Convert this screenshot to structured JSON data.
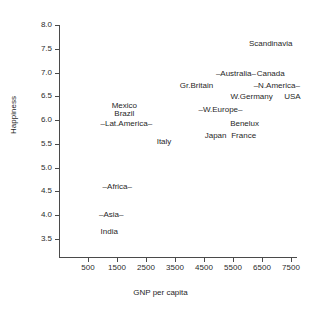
{
  "chart_data": {
    "type": "scatter",
    "title": "",
    "xlabel": "GNP per capita",
    "ylabel": "Happiness",
    "xlim": [
      0,
      7800
    ],
    "ylim": [
      3.3,
      8.0
    ],
    "grid": false,
    "legend": "none",
    "note": "Text labels are plotted in place of point markers; some labels are bracketed by en-dashes to denote aggregate regions.",
    "x_ticks": [
      500,
      1500,
      2500,
      3500,
      4500,
      5500,
      6500,
      7500
    ],
    "x_tick_labels": [
      "500",
      "1500",
      "2500",
      "3500",
      "4500",
      "5500",
      "6500",
      "7500"
    ],
    "y_ticks": [
      3.5,
      4.0,
      4.5,
      5.0,
      5.5,
      6.0,
      6.5,
      7.0,
      7.5,
      8.0
    ],
    "y_tick_labels": [
      "3.5",
      "4.0",
      "4.5",
      "5.0",
      "5.5",
      "6.0",
      "6.5",
      "7.0",
      "7.5",
      "8.0"
    ],
    "points": [
      {
        "label": "Scandinavia",
        "x": 6800,
        "y": 7.6
      },
      {
        "label": "–Australia–",
        "x": 5600,
        "y": 6.98
      },
      {
        "label": "Canada",
        "x": 6800,
        "y": 6.98
      },
      {
        "label": "–N.America–",
        "x": 7010,
        "y": 6.72
      },
      {
        "label": "Gr.Britain",
        "x": 4240,
        "y": 6.72
      },
      {
        "label": "W.Germany",
        "x": 6140,
        "y": 6.48
      },
      {
        "label": "USA",
        "x": 7550,
        "y": 6.48
      },
      {
        "label": "–W.Europe–",
        "x": 5070,
        "y": 6.21
      },
      {
        "label": "Mexico",
        "x": 1750,
        "y": 6.3
      },
      {
        "label": "Brazil",
        "x": 1750,
        "y": 6.12
      },
      {
        "label": "–Lat.America–",
        "x": 1820,
        "y": 5.92
      },
      {
        "label": "Benelux",
        "x": 5900,
        "y": 5.92
      },
      {
        "label": "Japan",
        "x": 4900,
        "y": 5.67
      },
      {
        "label": "France",
        "x": 5870,
        "y": 5.67
      },
      {
        "label": "Italy",
        "x": 3120,
        "y": 5.54
      },
      {
        "label": "–Africa–",
        "x": 1510,
        "y": 4.6
      },
      {
        "label": "–Asia–",
        "x": 1300,
        "y": 4.0
      },
      {
        "label": "India",
        "x": 1230,
        "y": 3.65
      }
    ]
  }
}
